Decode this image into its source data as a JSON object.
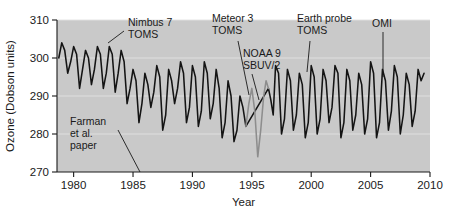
{
  "chart_data": {
    "type": "line",
    "title": "",
    "xlabel": "Year",
    "ylabel": "Ozone (Dobson units)",
    "xlim": [
      1978.6,
      2010.0
    ],
    "ylim": [
      270,
      310
    ],
    "xticks": [
      1980,
      1985,
      1990,
      1995,
      2000,
      2005,
      2010
    ],
    "xtick_labels": [
      "1980",
      "1985",
      "1990",
      "1995",
      "2000",
      "2005",
      "2010"
    ],
    "yticks": [
      270,
      280,
      290,
      300,
      310
    ],
    "ytick_labels": [
      "270",
      "280",
      "290",
      "300",
      "310"
    ],
    "grid": "horizontal-light",
    "legend": "none",
    "plot_background_color": "#c9c9c9",
    "series": [
      {
        "name": "Nimbus 7 TOMS / Meteor 3 TOMS / Earth probe TOMS / OMI",
        "color": "#141414",
        "x": [
          1978.75,
          1979.0,
          1979.25,
          1979.5,
          1979.75,
          1980.0,
          1980.25,
          1980.5,
          1980.75,
          1981.0,
          1981.25,
          1981.5,
          1981.75,
          1982.0,
          1982.25,
          1982.5,
          1982.75,
          1983.0,
          1983.25,
          1983.5,
          1983.75,
          1984.0,
          1984.25,
          1984.5,
          1984.75,
          1985.0,
          1985.25,
          1985.5,
          1985.75,
          1986.0,
          1986.25,
          1986.5,
          1986.75,
          1987.0,
          1987.25,
          1987.5,
          1987.75,
          1988.0,
          1988.25,
          1988.5,
          1988.75,
          1989.0,
          1989.25,
          1989.5,
          1989.75,
          1990.0,
          1990.25,
          1990.5,
          1990.75,
          1991.0,
          1991.25,
          1991.5,
          1991.75,
          1992.0,
          1992.25,
          1992.5,
          1992.75,
          1993.0,
          1993.25,
          1993.5,
          1993.75,
          1994.0,
          1994.25,
          1994.5,
          1996.4,
          1996.6,
          1996.8,
          1997.0,
          1997.25,
          1997.5,
          1997.75,
          1998.0,
          1998.25,
          1998.5,
          1998.75,
          1999.0,
          1999.25,
          1999.5,
          1999.75,
          2000.0,
          2000.25,
          2000.5,
          2000.75,
          2001.0,
          2001.25,
          2001.5,
          2001.75,
          2002.0,
          2002.25,
          2002.5,
          2002.75,
          2003.0,
          2003.25,
          2003.5,
          2003.75,
          2004.0,
          2004.25,
          2004.5,
          2004.75,
          2005.0,
          2005.25,
          2005.5,
          2005.75,
          2006.0,
          2006.25,
          2006.5,
          2006.75,
          2007.0,
          2007.25,
          2007.5,
          2007.75,
          2008.0,
          2008.25,
          2008.5,
          2008.75,
          2009.0,
          2009.25,
          2009.5
        ],
        "y": [
          300,
          304,
          302,
          296,
          299,
          303,
          301,
          292,
          297,
          302,
          300,
          293,
          297,
          303,
          301,
          292,
          296,
          303,
          301,
          291,
          296,
          302,
          299,
          288,
          292,
          297,
          294,
          283,
          288,
          296,
          293,
          287,
          291,
          298,
          295,
          281,
          285,
          297,
          294,
          288,
          292,
          299,
          296,
          283,
          287,
          298,
          295,
          282,
          286,
          299,
          296,
          284,
          288,
          297,
          292,
          279,
          283,
          294,
          290,
          278,
          281,
          290,
          287,
          282,
          292,
          289,
          285,
          298,
          296,
          280,
          284,
          297,
          294,
          281,
          285,
          296,
          293,
          279,
          283,
          298,
          295,
          280,
          284,
          297,
          294,
          283,
          287,
          298,
          296,
          279,
          283,
          297,
          294,
          281,
          285,
          296,
          293,
          280,
          284,
          299,
          296,
          279,
          283,
          297,
          294,
          281,
          286,
          298,
          295,
          280,
          285,
          296,
          293,
          282,
          286,
          297,
          294,
          296
        ]
      },
      {
        "name": "NOAA 9 SBUV/2",
        "color": "#8d8d8d",
        "x": [
          1994.5,
          1994.75,
          1995.0,
          1995.25,
          1995.5,
          1995.75,
          1996.0,
          1996.2,
          1996.4
        ],
        "y": [
          282,
          288,
          292,
          286,
          274,
          281,
          290,
          294,
          292
        ]
      }
    ],
    "annotations": [
      {
        "id": "nimbus7-toms",
        "lines": [
          "Nimbus 7",
          "TOMS"
        ],
        "text_x": 128,
        "text_y": 26,
        "leader": [
          [
            124,
            31
          ],
          [
            108,
            43
          ]
        ]
      },
      {
        "id": "meteor3-toms",
        "lines": [
          "Meteor 3",
          "TOMS"
        ],
        "text_x": 212,
        "text_y": 22,
        "leader": [
          [
            238,
            41
          ],
          [
            249,
            95
          ]
        ]
      },
      {
        "id": "noaa9-sbuv2",
        "lines": [
          "NOAA 9",
          "SBUV/2"
        ],
        "text_x": 243,
        "text_y": 57,
        "leader": [
          [
            252,
            74
          ],
          [
            259,
            100
          ]
        ]
      },
      {
        "id": "earth-probe-toms",
        "lines": [
          "Earth probe",
          "TOMS"
        ],
        "text_x": 297,
        "text_y": 22,
        "leader": [
          [
            310,
            41
          ],
          [
            307,
            72
          ]
        ]
      },
      {
        "id": "omi",
        "lines": [
          "OMI"
        ],
        "text_x": 372,
        "text_y": 27,
        "leader": [
          [
            383,
            32
          ],
          [
            383,
            77
          ]
        ]
      },
      {
        "id": "farman-et-al-paper",
        "lines": [
          "Farman",
          "et al.",
          "paper"
        ],
        "text_x": 70,
        "text_y": 125,
        "leader": [
          [
            118,
            130
          ],
          [
            140,
            172
          ]
        ]
      }
    ]
  }
}
